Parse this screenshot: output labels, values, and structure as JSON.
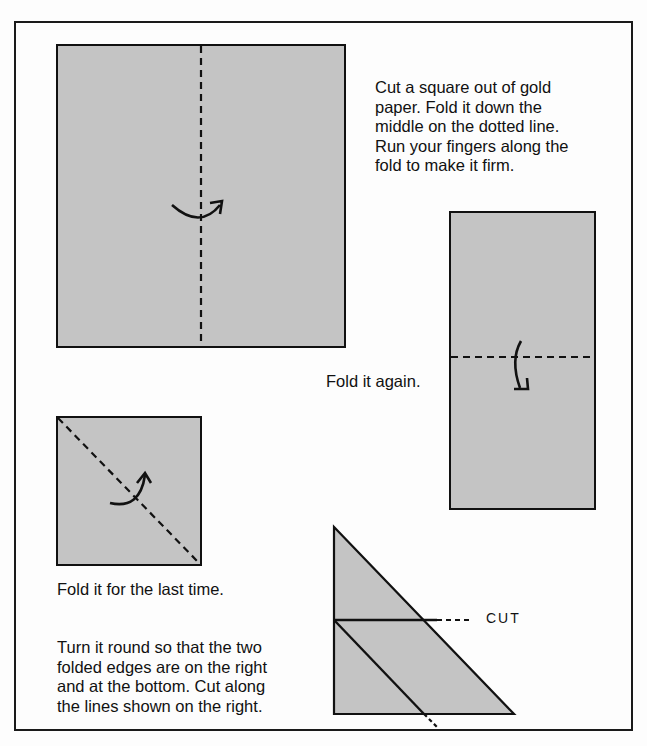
{
  "page": {
    "paper_color": "#c4c4c4",
    "line_color": "#111111"
  },
  "step1": {
    "text_lines": [
      "Cut a square out of gold",
      "paper. Fold it down the",
      "middle on the dotted line.",
      "Run your fingers along the",
      "fold to make it firm."
    ]
  },
  "step2": {
    "text": "Fold it again."
  },
  "step3": {
    "text": "Fold it for the last time."
  },
  "step4": {
    "text_lines": [
      "Turn it round so that the two",
      "folded edges are on the right",
      "and at the bottom. Cut along",
      "the lines shown on the right."
    ],
    "cut_label": "CUT"
  }
}
